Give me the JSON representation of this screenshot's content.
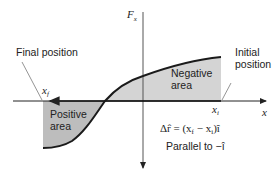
{
  "diagram": {
    "axes": {
      "y_label": "F",
      "y_label_sub": "x",
      "x_label": "x"
    },
    "points": {
      "final_label": "Final position",
      "final_symbol": "x",
      "final_sub": "f",
      "initial_label_line1": "Initial",
      "initial_label_line2": "position",
      "initial_symbol": "x",
      "initial_sub": "i"
    },
    "regions": {
      "negative_line1": "Negative",
      "negative_line2": "area",
      "positive_line1": "Positive",
      "positive_line2": "area"
    },
    "equation": {
      "lhs": "Δr̂ = (x",
      "sub_f": "f",
      "mid": " − x",
      "sub_i": "i",
      "rhs": ")î"
    },
    "note": "Parallel to −î",
    "colors": {
      "shade": "#cfcfcf",
      "curve": "#1a1a1a",
      "axis": "#333333",
      "leader": "#555555"
    }
  }
}
